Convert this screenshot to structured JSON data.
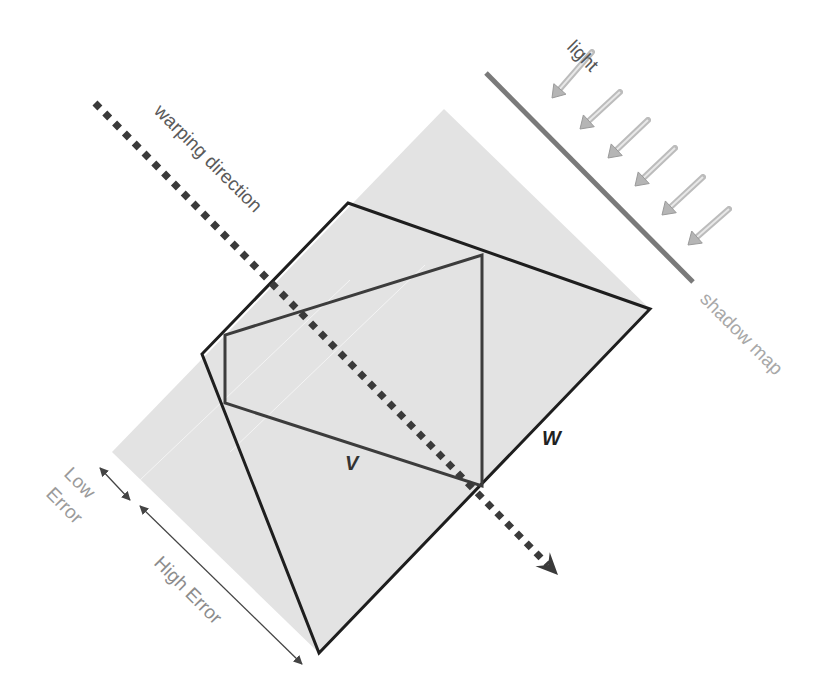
{
  "colors": {
    "background": "#ffffff",
    "band_fill": "#e3e3e3",
    "band_seam": "#f4f4f4",
    "outline_W": "#1e1e1e",
    "outline_V": "#3c3c3c",
    "warp_dots": "#3a3a3a",
    "shadow_map_line": "#7a7a7a",
    "light_arrow": "#b5b5b5",
    "light_label": "#555555",
    "warp_label": "#5a5a5a",
    "shadow_map_label": "#a8a8a8",
    "error_label": "#9a9a9a",
    "error_arrow": "#444444",
    "shape_label": "#333333"
  },
  "labels": {
    "light": "light",
    "warping_direction": "warping direction",
    "shadow_map": "shadow map",
    "V": "V",
    "W": "W",
    "low_error_line1": "Low",
    "low_error_line2": "Error",
    "high_error": "High Error"
  },
  "geometry": {
    "band": [
      [
        444,
        109
      ],
      [
        650,
        309
      ],
      [
        319,
        653
      ],
      [
        112,
        452
      ]
    ],
    "band_seams": [
      [
        [
          230,
          452
        ],
        [
          425,
          265
        ]
      ],
      [
        [
          140,
          480
        ],
        [
          350,
          280
        ]
      ]
    ],
    "polygon_W": [
      [
        348,
        203
      ],
      [
        650,
        309
      ],
      [
        319,
        653
      ],
      [
        202,
        354
      ]
    ],
    "polygon_V": [
      [
        482,
        255
      ],
      [
        482,
        486
      ],
      [
        225,
        403
      ],
      [
        225,
        335
      ]
    ],
    "warp_line": {
      "x1": 95,
      "y1": 103,
      "x2": 548,
      "y2": 565
    },
    "warp_arrow_tip": [
      558,
      575
    ],
    "shadow_map_line": {
      "x1": 486,
      "y1": 73,
      "x2": 693,
      "y2": 282
    },
    "light_arrows": [
      {
        "x1": 592,
        "y1": 52,
        "x2": 552,
        "y2": 98
      },
      {
        "x1": 620,
        "y1": 92,
        "x2": 580,
        "y2": 129
      },
      {
        "x1": 648,
        "y1": 120,
        "x2": 608,
        "y2": 158
      },
      {
        "x1": 675,
        "y1": 148,
        "x2": 635,
        "y2": 186
      },
      {
        "x1": 703,
        "y1": 177,
        "x2": 662,
        "y2": 215
      },
      {
        "x1": 729,
        "y1": 209,
        "x2": 688,
        "y2": 245
      }
    ],
    "low_error_arrow": {
      "x1": 100,
      "y1": 468,
      "x2": 130,
      "y2": 500
    },
    "high_error_arrow": {
      "x1": 140,
      "y1": 506,
      "x2": 302,
      "y2": 664
    }
  }
}
